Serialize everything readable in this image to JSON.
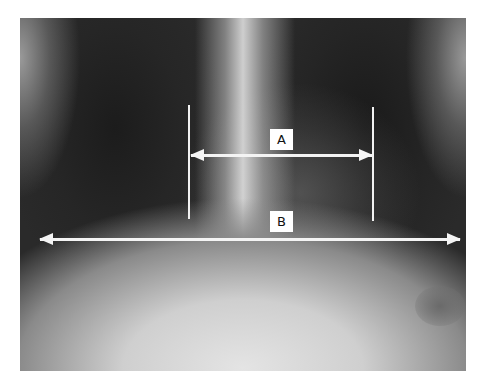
{
  "figure": {
    "measurements": [
      {
        "label": "A",
        "description": "cardiac width between vertical markers"
      },
      {
        "label": "B",
        "description": "thoracic width"
      }
    ]
  },
  "colors": {
    "background": "#ffffff",
    "markers": "#f4f4f4"
  }
}
